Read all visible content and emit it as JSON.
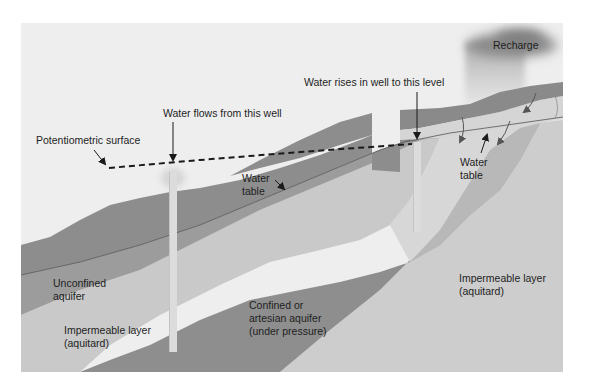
{
  "diagram": {
    "colors": {
      "sky": "#eeeeee",
      "surface_soil": "#8d8d8d",
      "unconfined_aquifer": "#9c9c9c",
      "upper_aquitard": "#c9c9c9",
      "confined_aquifer": "#8e8e8e",
      "lower_aquitard": "#cdcdcd",
      "recharge_zone": "#d7d7d7",
      "well": "#dcdcdc",
      "cloud": "#8a8a8a",
      "text": "#1e1e1e"
    },
    "labels": {
      "recharge": "Recharge",
      "water_rises": "Water rises in well to this level",
      "water_flows": "Water flows from this well",
      "potentiometric_surface": "Potentiometric surface",
      "water_table_left_line1": "Water",
      "water_table_left_line2": "table",
      "water_table_right_line1": "Water",
      "water_table_right_line2": "table",
      "unconfined_line1": "Unconfined",
      "unconfined_line2": "aquifer",
      "impermeable_left_line1": "Impermeable layer",
      "impermeable_left_line2": "(aquitard)",
      "confined_line1": "Confined or",
      "confined_line2": "artesian aquifer",
      "confined_line3": "(under pressure)",
      "impermeable_right_line1": "Impermeable layer",
      "impermeable_right_line2": "(aquitard)"
    },
    "icons": {
      "flowing_well": "well-with-fountain-icon",
      "artesian_well": "well-icon",
      "rain_cloud": "rain-cloud-icon",
      "infiltration_arrows": "curved-arrow-icon"
    }
  }
}
